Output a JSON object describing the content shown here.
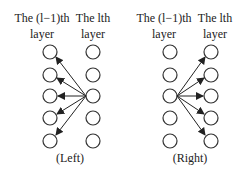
{
  "left_panel": {
    "prev_layer_label_line1": "The (l−1)th",
    "prev_layer_label_line2": "layer",
    "curr_layer_label_line1": "The lth",
    "curr_layer_label_line2": "layer",
    "caption": "(Left)"
  },
  "right_panel": {
    "prev_layer_label_line1": "The (l−1)th",
    "prev_layer_label_line2": "layer",
    "curr_layer_label_line1": "The lth",
    "curr_layer_label_line2": "layer",
    "caption": "(Right)"
  },
  "nodes_per_layer": 5,
  "colors": {
    "stroke": "#333333",
    "background": "#ffffff"
  }
}
